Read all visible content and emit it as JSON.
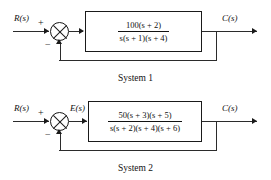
{
  "figure": {
    "type": "control-system-block-diagram",
    "systems": [
      {
        "caption": "System 1",
        "input_label": "R(s)",
        "output_label": "C(s)",
        "error_label": "",
        "summing_junction": {
          "input_sign": "+",
          "feedback_sign": "−",
          "symbol": "crossed-circle"
        },
        "transfer_function": {
          "numerator": "100(s + 2)",
          "denominator": "s(s + 1)(s + 4)",
          "gain": 100,
          "zeros": [
            -2
          ],
          "poles": [
            0,
            -1,
            -4
          ]
        },
        "feedback_path": "unity"
      },
      {
        "caption": "System 2",
        "input_label": "R(s)",
        "output_label": "C(s)",
        "error_label": "E(s)",
        "summing_junction": {
          "input_sign": "+",
          "feedback_sign": "−",
          "symbol": "crossed-circle"
        },
        "transfer_function": {
          "numerator": "50(s + 3)(s + 5)",
          "denominator": "s(s + 2)(s + 4)(s + 6)",
          "gain": 50,
          "zeros": [
            -3,
            -5
          ],
          "poles": [
            0,
            -2,
            -4,
            -6
          ]
        },
        "feedback_path": "unity"
      }
    ],
    "colors": {
      "line": "#2b2b2b",
      "block_border": "#1a1a1a",
      "text": "#111111",
      "background": "#ffffff"
    }
  }
}
